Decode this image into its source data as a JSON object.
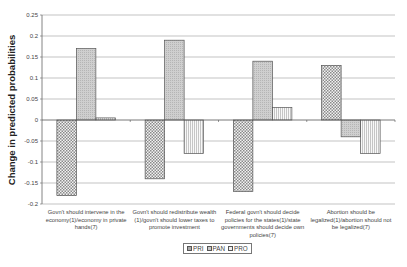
{
  "chart_data": {
    "type": "bar",
    "title": "",
    "xlabel": "",
    "ylabel": "Change in predicted probabilities",
    "ylim": [
      -0.2,
      0.25
    ],
    "yticks": [
      0.25,
      0.2,
      0.15,
      0.1,
      0.05,
      0,
      -0.05,
      -0.1,
      -0.15,
      -0.2
    ],
    "ytick_labels": [
      "0.25",
      "0.2",
      "0.15",
      "0.1",
      "0.05",
      "0",
      "-0.05",
      "-0.1",
      "-0.15",
      "-0.2"
    ],
    "grid": true,
    "legend_position": "bottom",
    "categories": [
      "Govn't should intervene in the economy(1)/economy in private hands(7)",
      "Govn't should redistribute wealth (1)/govn't should lower taxes to promote investment",
      "Federal govn't should decide policies for the states(1)/state governments should decide own policies(7)",
      "Abortion should be legalized(1)/abortion should not be legalized(7)"
    ],
    "series": [
      {
        "name": "PRI",
        "pattern": "checker",
        "values": [
          -0.18,
          -0.14,
          -0.17,
          0.13
        ]
      },
      {
        "name": "PAN",
        "pattern": "dotted-gray",
        "values": [
          0.17,
          0.19,
          0.14,
          -0.04
        ]
      },
      {
        "name": "PRO",
        "pattern": "vertical-lines",
        "values": [
          0.005,
          -0.08,
          0.03,
          -0.08
        ]
      }
    ]
  },
  "xlabels": [
    [
      "Govn't should intervene in the",
      "economy(1)/economy in private",
      "hands(7)"
    ],
    [
      "Govn't should redistribute wealth",
      "(1)/govn't should lower taxes to",
      "promote investment"
    ],
    [
      "Federal govn't should decide",
      "policies for the states(1)/state",
      "governments should decide own",
      "policies(7)"
    ],
    [
      "Abortion should be",
      "legalized(1)/abortion should not",
      "be legalized(7)"
    ]
  ],
  "legend": {
    "items": [
      {
        "label": "PRI"
      },
      {
        "label": "PAN"
      },
      {
        "label": "PRO"
      }
    ]
  }
}
